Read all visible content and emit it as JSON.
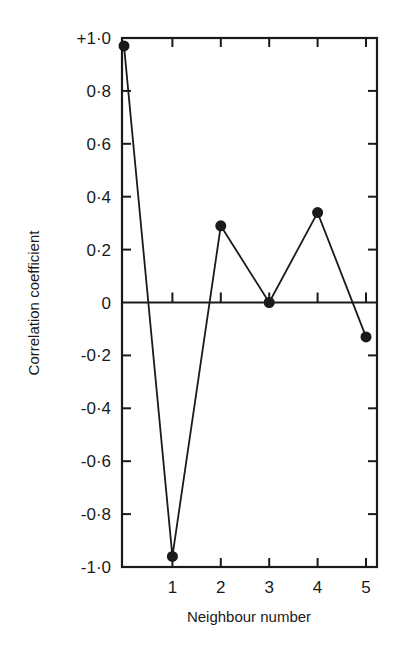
{
  "chart_data": {
    "type": "line",
    "title": "",
    "xlabel": "Neighbour number",
    "ylabel": "Correlation coefficient",
    "x": [
      0,
      1,
      2,
      3,
      4,
      5
    ],
    "series": [
      {
        "name": "Correlation coefficient",
        "values": [
          0.97,
          -0.96,
          0.29,
          0.0,
          0.34,
          -0.13
        ],
        "marker": "filled-circle"
      }
    ],
    "xlim": [
      0,
      5.3
    ],
    "ylim": [
      -1.0,
      1.0
    ],
    "x_ticks": [
      1,
      2,
      3,
      4,
      5
    ],
    "x_tick_labels": [
      "1",
      "2",
      "3",
      "4",
      "5"
    ],
    "y_ticks": [
      1.0,
      0.8,
      0.6,
      0.4,
      0.2,
      0,
      -0.2,
      -0.4,
      -0.6,
      -0.8,
      -1.0
    ],
    "y_tick_labels": [
      "+1·0",
      "0·8",
      "0·6",
      "0·4",
      "0·2",
      "0",
      "-0·2",
      "-0·4",
      "-0·6",
      "-0·8",
      "-1·0"
    ],
    "zero_line": true,
    "grid": false,
    "legend": null,
    "colors": {
      "ink": "#1a1a1a",
      "background": "#ffffff"
    }
  }
}
